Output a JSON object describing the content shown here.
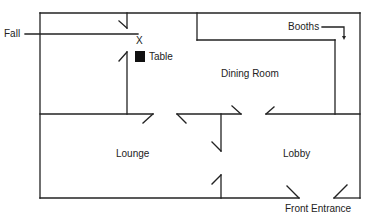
{
  "diagram": {
    "type": "floor-plan",
    "colors": {
      "line": "#222222",
      "background": "#ffffff",
      "table": "#111111"
    },
    "rooms": [
      {
        "name": "Dining Room",
        "label": "Dining Room",
        "x": 220,
        "y": 70
      },
      {
        "name": "Lounge",
        "label": "Lounge",
        "x": 116,
        "y": 150
      },
      {
        "name": "Lobby",
        "label": "Lobby",
        "x": 282,
        "y": 150
      }
    ],
    "annotations": {
      "fall": "Fall",
      "booths": "Booths",
      "table": "Table",
      "x_mark": "X",
      "front_entrance": "Front Entrance"
    },
    "walls": [
      [
        40,
        13,
        360,
        13
      ],
      [
        40,
        13,
        40,
        198
      ],
      [
        360,
        13,
        360,
        198
      ],
      [
        40,
        198,
        299,
        198
      ],
      [
        334,
        198,
        360,
        198
      ],
      [
        40,
        114,
        153,
        114
      ],
      [
        177,
        114,
        241,
        114
      ],
      [
        266,
        114,
        360,
        114
      ],
      [
        127,
        13,
        127,
        28
      ],
      [
        127,
        52,
        127,
        114
      ],
      [
        197,
        13,
        197,
        40
      ],
      [
        197,
        40,
        335,
        40
      ],
      [
        335,
        40,
        335,
        114
      ],
      [
        221,
        114,
        221,
        151
      ],
      [
        221,
        175,
        221,
        198
      ]
    ],
    "door_swings": [
      [
        119,
        21,
        127,
        28
      ],
      [
        119,
        61,
        127,
        52
      ],
      [
        143,
        123,
        153,
        114
      ],
      [
        177,
        114,
        186,
        123
      ],
      [
        232,
        106,
        241,
        114
      ],
      [
        266,
        114,
        274,
        107
      ],
      [
        212,
        142,
        221,
        151
      ],
      [
        212,
        184,
        221,
        175
      ],
      [
        287,
        186,
        299,
        198
      ],
      [
        334,
        198,
        347,
        185
      ]
    ],
    "fall_line": [
      25,
      34,
      138,
      34
    ],
    "booths_arrow": {
      "path": "M 322 27 L 344 27 L 344 37",
      "head": [
        344,
        40
      ]
    }
  }
}
